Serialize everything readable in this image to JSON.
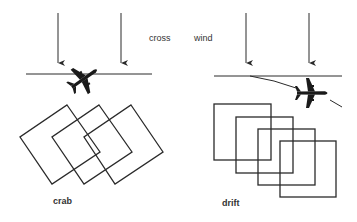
{
  "diagram": {
    "labels": {
      "cross": "cross",
      "wind": "wind",
      "crab": "crab",
      "drift": "drift"
    },
    "panels": [
      {
        "id": "crab",
        "description": "Aircraft heading into crosswind (crabbing) over straight flight line; photo frames rotated but overlapping along track",
        "frame_count": 3
      },
      {
        "id": "drift",
        "description": "Aircraft drifting off flight line due to crosswind; photo frames square but offset diagonally",
        "frame_count": 4
      }
    ],
    "wind_arrows_per_panel": 2,
    "colors": {
      "line": "#2a2a2a",
      "background": "#ffffff",
      "text": "#333333"
    }
  }
}
